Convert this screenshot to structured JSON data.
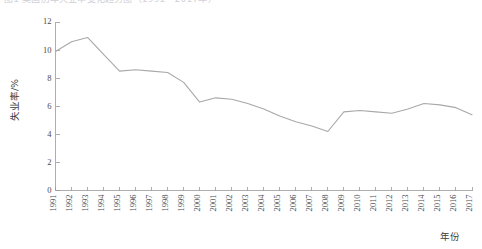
{
  "figure": {
    "top_caption": "图1  美国历年失业率变化趋势图（1991—2017年）",
    "background": "#ffffff",
    "line_color": "#a8a8a8",
    "axis_color": "#9a9a9a"
  },
  "chart_data": {
    "type": "line",
    "title": "",
    "xlabel": "年份",
    "ylabel": "失业率/%",
    "grid": false,
    "legend": null,
    "xlim": [
      1991,
      2017
    ],
    "ylim": [
      0,
      12
    ],
    "yticks": [
      0,
      2,
      4,
      6,
      8,
      10,
      12
    ],
    "ytick_labels": [
      "0",
      "2",
      "4",
      "6",
      "8",
      "10",
      "12"
    ],
    "categories": [
      "1991",
      "1992",
      "1993",
      "1994",
      "1995",
      "1996",
      "1997",
      "1998",
      "1999",
      "2000",
      "2001",
      "2002",
      "2003",
      "2004",
      "2005",
      "2006",
      "2007",
      "2008",
      "2009",
      "2010",
      "2011",
      "2012",
      "2013",
      "2014",
      "2015",
      "2016",
      "2017"
    ],
    "values": [
      9.9,
      10.6,
      10.9,
      9.7,
      8.5,
      8.6,
      8.5,
      8.4,
      7.7,
      6.3,
      6.6,
      6.5,
      6.2,
      5.8,
      5.3,
      4.9,
      4.6,
      4.2,
      5.6,
      5.7,
      5.6,
      5.5,
      5.8,
      6.2,
      6.1,
      5.9,
      5.4
    ]
  }
}
